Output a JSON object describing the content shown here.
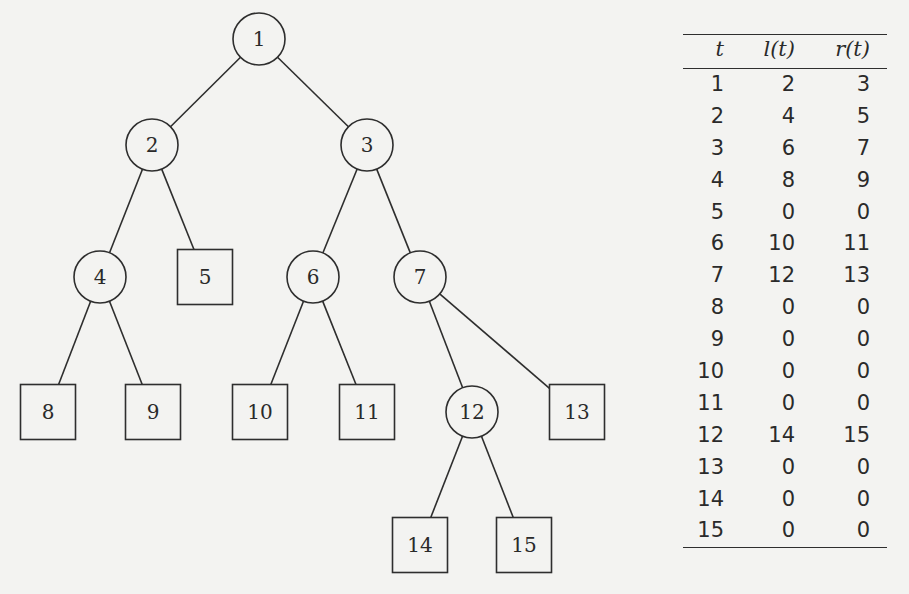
{
  "tree": {
    "nodes": [
      {
        "id": "1",
        "shape": "circle",
        "x": 259,
        "y": 39
      },
      {
        "id": "2",
        "shape": "circle",
        "x": 152,
        "y": 145
      },
      {
        "id": "3",
        "shape": "circle",
        "x": 367,
        "y": 145
      },
      {
        "id": "4",
        "shape": "circle",
        "x": 100,
        "y": 277
      },
      {
        "id": "5",
        "shape": "square",
        "x": 205,
        "y": 277
      },
      {
        "id": "6",
        "shape": "circle",
        "x": 313,
        "y": 277
      },
      {
        "id": "7",
        "shape": "circle",
        "x": 420,
        "y": 277
      },
      {
        "id": "8",
        "shape": "square",
        "x": 48,
        "y": 412
      },
      {
        "id": "9",
        "shape": "square",
        "x": 153,
        "y": 412
      },
      {
        "id": "10",
        "shape": "square",
        "x": 260,
        "y": 412
      },
      {
        "id": "11",
        "shape": "square",
        "x": 367,
        "y": 412
      },
      {
        "id": "12",
        "shape": "circle",
        "x": 472,
        "y": 412
      },
      {
        "id": "13",
        "shape": "square",
        "x": 577,
        "y": 412
      },
      {
        "id": "14",
        "shape": "square",
        "x": 420,
        "y": 545
      },
      {
        "id": "15",
        "shape": "square",
        "x": 524,
        "y": 545
      }
    ],
    "edges": [
      [
        "1",
        "2"
      ],
      [
        "1",
        "3"
      ],
      [
        "2",
        "4"
      ],
      [
        "2",
        "5"
      ],
      [
        "3",
        "6"
      ],
      [
        "3",
        "7"
      ],
      [
        "4",
        "8"
      ],
      [
        "4",
        "9"
      ],
      [
        "6",
        "10"
      ],
      [
        "6",
        "11"
      ],
      [
        "7",
        "12"
      ],
      [
        "7",
        "13"
      ],
      [
        "12",
        "14"
      ],
      [
        "12",
        "15"
      ]
    ]
  },
  "table": {
    "headers": [
      "t",
      "l(t)",
      "r(t)"
    ],
    "rows": [
      [
        "1",
        "2",
        "3"
      ],
      [
        "2",
        "4",
        "5"
      ],
      [
        "3",
        "6",
        "7"
      ],
      [
        "4",
        "8",
        "9"
      ],
      [
        "5",
        "0",
        "0"
      ],
      [
        "6",
        "10",
        "11"
      ],
      [
        "7",
        "12",
        "13"
      ],
      [
        "8",
        "0",
        "0"
      ],
      [
        "9",
        "0",
        "0"
      ],
      [
        "10",
        "0",
        "0"
      ],
      [
        "11",
        "0",
        "0"
      ],
      [
        "12",
        "14",
        "15"
      ],
      [
        "13",
        "0",
        "0"
      ],
      [
        "14",
        "0",
        "0"
      ],
      [
        "15",
        "0",
        "0"
      ]
    ]
  }
}
